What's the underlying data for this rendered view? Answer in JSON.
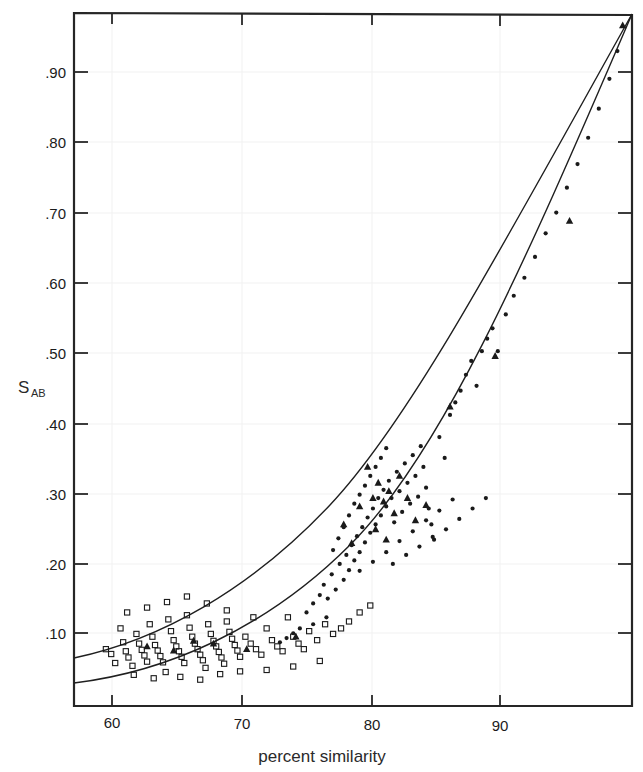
{
  "figure": {
    "background_color": "#ffffff",
    "frame_color": "#262626",
    "grid_color": "#f0f0f0",
    "marker_color": "#1a1a1a",
    "curve_color": "#1f1f1f"
  },
  "axis_titles": {
    "x_label": "percent similarity",
    "y_label_main": "S",
    "y_label_sub": "AB"
  },
  "chart_data": {
    "type": "scatter",
    "title": "",
    "subtitle": "",
    "xlabel": "percent similarity",
    "ylabel": "S_AB",
    "xlim": [
      56.5,
      98.5
    ],
    "ylim": [
      0.0,
      1.0
    ],
    "xticks": [
      60,
      70,
      80,
      90
    ],
    "xtick_labels": [
      "60",
      "70",
      "80",
      "90"
    ],
    "yticks": [
      0.1,
      0.2,
      0.3,
      0.4,
      0.5,
      0.6,
      0.7,
      0.8,
      0.9
    ],
    "ytick_labels": [
      ".10",
      ".20",
      ".30",
      ".40",
      ".50",
      ".60",
      ".70",
      ".80",
      ".90"
    ],
    "grid": "faint-both",
    "legend": "none",
    "legend_position": "none",
    "series": [
      {
        "name": "open squares (low similarity group)",
        "marker": "open-square",
        "points": [
          [
            58.9,
            0.082
          ],
          [
            59.3,
            0.075
          ],
          [
            59.6,
            0.062
          ],
          [
            60.0,
            0.112
          ],
          [
            60.2,
            0.092
          ],
          [
            60.4,
            0.079
          ],
          [
            60.6,
            0.07
          ],
          [
            60.9,
            0.058
          ],
          [
            61.2,
            0.104
          ],
          [
            61.4,
            0.09
          ],
          [
            61.6,
            0.081
          ],
          [
            61.8,
            0.073
          ],
          [
            62.0,
            0.064
          ],
          [
            62.2,
            0.118
          ],
          [
            62.4,
            0.1
          ],
          [
            62.6,
            0.088
          ],
          [
            62.8,
            0.08
          ],
          [
            63.0,
            0.072
          ],
          [
            63.2,
            0.063
          ],
          [
            63.4,
            0.049
          ],
          [
            63.6,
            0.125
          ],
          [
            63.8,
            0.108
          ],
          [
            64.0,
            0.095
          ],
          [
            64.2,
            0.086
          ],
          [
            64.4,
            0.079
          ],
          [
            64.6,
            0.071
          ],
          [
            64.8,
            0.062
          ],
          [
            65.0,
            0.131
          ],
          [
            65.2,
            0.113
          ],
          [
            65.4,
            0.1
          ],
          [
            65.6,
            0.09
          ],
          [
            65.8,
            0.082
          ],
          [
            66.0,
            0.074
          ],
          [
            66.2,
            0.066
          ],
          [
            66.4,
            0.055
          ],
          [
            66.6,
            0.118
          ],
          [
            66.8,
            0.104
          ],
          [
            67.0,
            0.094
          ],
          [
            67.2,
            0.086
          ],
          [
            67.4,
            0.078
          ],
          [
            67.6,
            0.07
          ],
          [
            67.8,
            0.061
          ],
          [
            68.0,
            0.122
          ],
          [
            68.2,
            0.107
          ],
          [
            68.4,
            0.097
          ],
          [
            68.6,
            0.088
          ],
          [
            68.8,
            0.08
          ],
          [
            69.0,
            0.071
          ],
          [
            69.4,
            0.1
          ],
          [
            69.8,
            0.09
          ],
          [
            70.2,
            0.082
          ],
          [
            70.6,
            0.074
          ],
          [
            71.0,
            0.112
          ],
          [
            71.4,
            0.095
          ],
          [
            71.8,
            0.086
          ],
          [
            72.2,
            0.079
          ],
          [
            72.6,
            0.128
          ],
          [
            73.0,
            0.1
          ],
          [
            73.4,
            0.09
          ],
          [
            73.8,
            0.082
          ],
          [
            74.2,
            0.108
          ],
          [
            74.8,
            0.095
          ],
          [
            75.4,
            0.118
          ],
          [
            76.0,
            0.104
          ],
          [
            76.6,
            0.112
          ],
          [
            77.2,
            0.122
          ],
          [
            78.0,
            0.135
          ],
          [
            78.8,
            0.145
          ],
          [
            61.0,
            0.045
          ],
          [
            62.5,
            0.04
          ],
          [
            64.5,
            0.042
          ],
          [
            66.0,
            0.038
          ],
          [
            67.5,
            0.046
          ],
          [
            69.0,
            0.05
          ],
          [
            71.0,
            0.052
          ],
          [
            73.0,
            0.057
          ],
          [
            75.0,
            0.065
          ],
          [
            60.5,
            0.135
          ],
          [
            62.0,
            0.142
          ],
          [
            63.5,
            0.15
          ],
          [
            65.0,
            0.158
          ],
          [
            66.5,
            0.148
          ],
          [
            68.0,
            0.138
          ],
          [
            70.0,
            0.128
          ]
        ]
      },
      {
        "name": "filled circles (mid/high similarity group)",
        "marker": "filled-circle",
        "points": [
          [
            72.5,
            0.098
          ],
          [
            73.5,
            0.112
          ],
          [
            74.0,
            0.135
          ],
          [
            74.5,
            0.148
          ],
          [
            75.0,
            0.16
          ],
          [
            75.3,
            0.175
          ],
          [
            75.6,
            0.155
          ],
          [
            75.9,
            0.19
          ],
          [
            76.2,
            0.168
          ],
          [
            76.5,
            0.205
          ],
          [
            76.8,
            0.182
          ],
          [
            77.0,
            0.218
          ],
          [
            77.2,
            0.196
          ],
          [
            77.4,
            0.232
          ],
          [
            77.6,
            0.21
          ],
          [
            77.8,
            0.245
          ],
          [
            78.0,
            0.222
          ],
          [
            78.2,
            0.258
          ],
          [
            78.4,
            0.236
          ],
          [
            78.6,
            0.272
          ],
          [
            78.8,
            0.25
          ],
          [
            79.0,
            0.285
          ],
          [
            79.2,
            0.262
          ],
          [
            79.4,
            0.3
          ],
          [
            79.6,
            0.275
          ],
          [
            79.8,
            0.312
          ],
          [
            80.0,
            0.288
          ],
          [
            80.2,
            0.325
          ],
          [
            80.4,
            0.3
          ],
          [
            80.6,
            0.265
          ],
          [
            80.8,
            0.338
          ],
          [
            81.0,
            0.31
          ],
          [
            81.2,
            0.28
          ],
          [
            81.4,
            0.35
          ],
          [
            81.6,
            0.322
          ],
          [
            81.8,
            0.292
          ],
          [
            82.0,
            0.362
          ],
          [
            82.2,
            0.332
          ],
          [
            82.4,
            0.302
          ],
          [
            82.6,
            0.375
          ],
          [
            82.8,
            0.345
          ],
          [
            83.0,
            0.315
          ],
          [
            83.2,
            0.285
          ],
          [
            83.4,
            0.262
          ],
          [
            83.6,
            0.24
          ],
          [
            84.0,
            0.388
          ],
          [
            84.4,
            0.358
          ],
          [
            84.8,
            0.42
          ],
          [
            85.2,
            0.438
          ],
          [
            85.6,
            0.455
          ],
          [
            86.0,
            0.478
          ],
          [
            86.4,
            0.498
          ],
          [
            86.8,
            0.462
          ],
          [
            87.2,
            0.512
          ],
          [
            87.6,
            0.53
          ],
          [
            88.0,
            0.545
          ],
          [
            88.4,
            0.512
          ],
          [
            89.0,
            0.565
          ],
          [
            89.6,
            0.592
          ],
          [
            90.4,
            0.618
          ],
          [
            91.2,
            0.648
          ],
          [
            92.0,
            0.682
          ],
          [
            92.8,
            0.712
          ],
          [
            93.6,
            0.748
          ],
          [
            94.4,
            0.782
          ],
          [
            95.2,
            0.82
          ],
          [
            96.0,
            0.862
          ],
          [
            96.8,
            0.905
          ],
          [
            97.4,
            0.945
          ],
          [
            76.0,
            0.225
          ],
          [
            76.4,
            0.242
          ],
          [
            76.8,
            0.258
          ],
          [
            77.2,
            0.275
          ],
          [
            77.6,
            0.292
          ],
          [
            78.0,
            0.305
          ],
          [
            78.4,
            0.318
          ],
          [
            78.8,
            0.332
          ],
          [
            79.2,
            0.345
          ],
          [
            79.6,
            0.358
          ],
          [
            80.0,
            0.372
          ],
          [
            75.5,
            0.128
          ],
          [
            74.5,
            0.118
          ],
          [
            73.0,
            0.105
          ],
          [
            72.0,
            0.092
          ],
          [
            78.0,
            0.195
          ],
          [
            79.0,
            0.208
          ],
          [
            80.0,
            0.222
          ],
          [
            81.0,
            0.238
          ],
          [
            82.0,
            0.252
          ],
          [
            83.0,
            0.268
          ],
          [
            84.0,
            0.282
          ],
          [
            85.0,
            0.298
          ],
          [
            80.5,
            0.205
          ],
          [
            81.5,
            0.218
          ],
          [
            82.5,
            0.23
          ],
          [
            83.5,
            0.244
          ],
          [
            84.5,
            0.255
          ],
          [
            85.5,
            0.27
          ],
          [
            86.5,
            0.285
          ],
          [
            87.5,
            0.3
          ]
        ]
      },
      {
        "name": "filled triangles",
        "marker": "filled-triangle",
        "points": [
          [
            62.0,
            0.086
          ],
          [
            64.0,
            0.08
          ],
          [
            65.5,
            0.094
          ],
          [
            67.0,
            0.09
          ],
          [
            69.5,
            0.082
          ],
          [
            73.2,
            0.1
          ],
          [
            76.8,
            0.262
          ],
          [
            78.0,
            0.288
          ],
          [
            78.6,
            0.345
          ],
          [
            79.0,
            0.3
          ],
          [
            79.4,
            0.322
          ],
          [
            79.8,
            0.295
          ],
          [
            80.2,
            0.31
          ],
          [
            80.6,
            0.278
          ],
          [
            81.0,
            0.332
          ],
          [
            81.6,
            0.3
          ],
          [
            82.2,
            0.268
          ],
          [
            83.0,
            0.29
          ],
          [
            84.8,
            0.432
          ],
          [
            88.2,
            0.505
          ],
          [
            93.8,
            0.7
          ],
          [
            97.8,
            0.982
          ],
          [
            77.4,
            0.235
          ],
          [
            79.2,
            0.255
          ],
          [
            80.0,
            0.24
          ]
        ]
      }
    ],
    "fitted_curves": [
      {
        "name": "upper fitted curve",
        "description": "Upper regression curve, rises from ~(57,0.072) to convergence at ~(98.3,1.0)",
        "endpoints": [
          [
            56.6,
            0.072
          ],
          [
            98.3,
            1.0
          ]
        ]
      },
      {
        "name": "lower fitted curve",
        "description": "Lower regression curve, rises from ~(57,0.036) to convergence at ~(98.3,1.0)",
        "endpoints": [
          [
            56.6,
            0.036
          ],
          [
            98.3,
            1.0
          ]
        ]
      }
    ]
  }
}
